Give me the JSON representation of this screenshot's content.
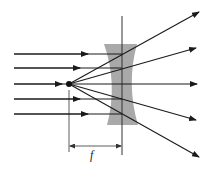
{
  "diagram": {
    "type": "optics-ray-diagram",
    "focal_length_label": "f",
    "colors": {
      "ray": "#1a1a1a",
      "lens_fill": "#9a9a9a",
      "axis_line": "#333333",
      "background": "#ffffff"
    },
    "incoming_rays": [
      {
        "y": 54,
        "arrow_x": 86
      },
      {
        "y": 68,
        "arrow_x": 78
      },
      {
        "y": 84,
        "arrow_x": 60
      },
      {
        "y": 99,
        "arrow_x": 78
      },
      {
        "y": 114,
        "arrow_x": 86
      }
    ],
    "outgoing_rays": [
      {
        "end_x": 199,
        "end_y": 12
      },
      {
        "end_x": 196,
        "end_y": 48
      },
      {
        "end_x": 197,
        "end_y": 84
      },
      {
        "end_x": 196,
        "end_y": 120
      },
      {
        "end_x": 199,
        "end_y": 157
      }
    ],
    "focal_point": {
      "x": 69,
      "y": 84
    },
    "lens_plane_x": 122
  }
}
